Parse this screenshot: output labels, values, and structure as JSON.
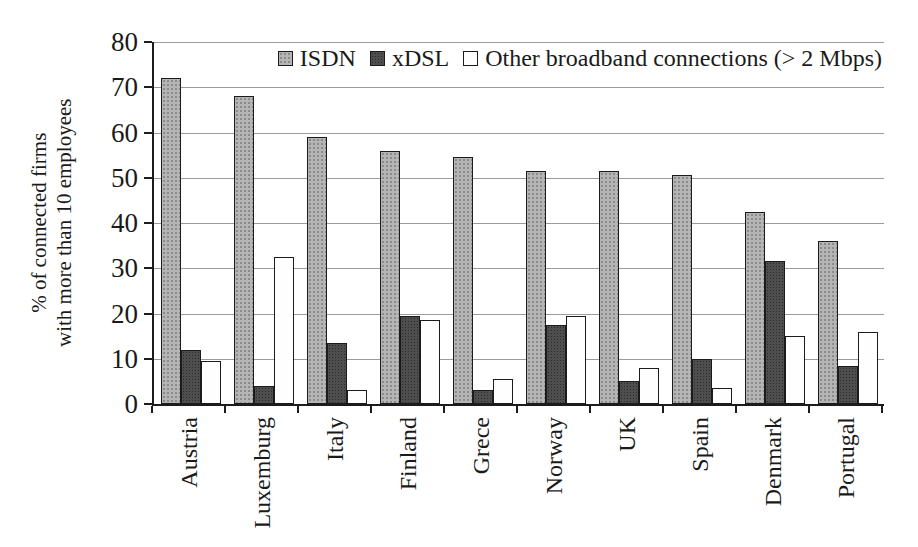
{
  "chart_data": {
    "type": "bar",
    "title": "",
    "ylabel_line1": "% of connected firms",
    "ylabel_line2": "with more than 10 employees",
    "xlabel": "",
    "ylim": [
      0,
      80
    ],
    "ytick_step": 10,
    "yticks": [
      80,
      70,
      60,
      50,
      40,
      30,
      20,
      10,
      0
    ],
    "grid": true,
    "legend_position": "top-inside-right",
    "categories": [
      "Austria",
      "Luxemburg",
      "Italy",
      "Finland",
      "Grece",
      "Norway",
      "UK",
      "Spain",
      "Denmark",
      "Portugal"
    ],
    "series": [
      {
        "name": "ISDN",
        "values": [
          72,
          68,
          59,
          56,
          54.5,
          51.5,
          51.5,
          50.5,
          42.5,
          36
        ],
        "fill": "#b5b5b5"
      },
      {
        "name": "xDSL",
        "values": [
          12,
          4,
          13.5,
          19.5,
          3,
          17.5,
          5,
          10,
          31.5,
          8.5
        ],
        "fill": "#4e4e4e"
      },
      {
        "name": "Other broadband connections (> 2 Mbps)",
        "values": [
          9.5,
          32.5,
          3,
          18.5,
          5.5,
          19.5,
          8,
          3.5,
          15,
          16
        ],
        "fill": "#fefefe"
      }
    ],
    "colors": {
      "bar_border": "#1b1b1b",
      "gridline": "#9b9b9b",
      "axis": "#1c1c1c",
      "text": "#1a1a1a",
      "background": "#ffffff"
    }
  }
}
